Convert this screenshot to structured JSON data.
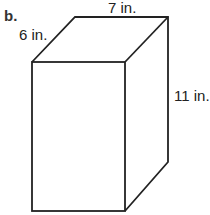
{
  "part_label": "b.",
  "shape": "rectangular prism",
  "dimensions": {
    "depth": "6 in.",
    "width": "7 in.",
    "height": "11 in."
  }
}
